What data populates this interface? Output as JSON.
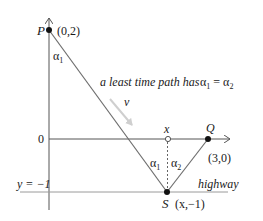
{
  "diagram": {
    "type": "geometry-least-time-path",
    "points": {
      "P": {
        "label": "P",
        "coords": "(0,2)"
      },
      "Q": {
        "label": "Q",
        "coords": "(3,0)"
      },
      "S": {
        "label": "S",
        "coords": "(x,−1)"
      },
      "X": {
        "label": "x"
      }
    },
    "axis_labels": {
      "zero": "0",
      "highway_y": "y = −1"
    },
    "angle_labels": {
      "alpha1_top": "α",
      "alpha1_top_sub": "1",
      "alpha1_bottom": "α",
      "alpha1_bottom_sub": "1",
      "alpha2_bottom": "α",
      "alpha2_bottom_sub": "2"
    },
    "annotation": {
      "text": "a least time path has",
      "eq_a": "α",
      "eq_a_sub": "1",
      "eq_sign": " = ",
      "eq_b": "α",
      "eq_b_sub": "2"
    },
    "velocity_label": "v",
    "highway_label": "highway",
    "colors": {
      "line": "#6e6e6e",
      "dots": "#111111",
      "velocity_arrow": "#c8c8c8",
      "text": "#1a1a1a"
    }
  }
}
